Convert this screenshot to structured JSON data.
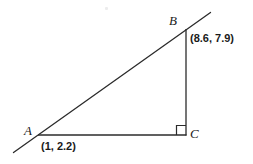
{
  "figure": {
    "background_color": "#ffffff",
    "stroke_color": "#2b2b2b",
    "vertices": [
      {
        "name": "A",
        "label": "A",
        "coord_label": "(1, 2.2)",
        "x_data": 1,
        "y_data": 2.2,
        "px": 38,
        "py": 135
      },
      {
        "name": "B",
        "label": "B",
        "coord_label": "(8.6, 7.9)",
        "x_data": 8.6,
        "y_data": 7.9,
        "px": 186,
        "py": 29
      },
      {
        "name": "C",
        "label": "C",
        "coord_label": "",
        "x_data": 8.6,
        "y_data": 2.2,
        "px": 186,
        "py": 135
      }
    ],
    "segments": [
      {
        "name": "hypotenuse-AB",
        "from": "A",
        "to": "B",
        "extended": true
      },
      {
        "name": "leg-AC",
        "from": "A",
        "to": "C",
        "extended": false
      },
      {
        "name": "leg-BC",
        "from": "B",
        "to": "C",
        "extended": false
      }
    ],
    "right_angle": {
      "at": "C",
      "marker": "square"
    }
  }
}
